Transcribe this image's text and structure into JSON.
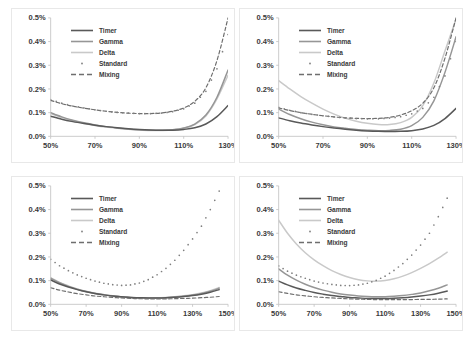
{
  "figure": {
    "layout": "2x2 grid of line charts",
    "background_color": "#ffffff",
    "panel_border_color": "#e8e8e8"
  },
  "series_styles": {
    "Timer": {
      "color": "#595959",
      "style": "solid",
      "width": 1.5
    },
    "Gamma": {
      "color": "#969696",
      "style": "solid",
      "width": 1.5
    },
    "Delta": {
      "color": "#c9c9c9",
      "style": "solid",
      "width": 1.5
    },
    "Standard": {
      "color": "#7f7f7f",
      "style": "dotted-markers",
      "width": 1
    },
    "Mixing": {
      "color": "#6e6e6e",
      "style": "dashed",
      "width": 1.2
    }
  },
  "legend": {
    "entries": [
      {
        "label": "Timer",
        "key": "line-solid-dark"
      },
      {
        "label": "Gamma",
        "key": "line-solid-medium"
      },
      {
        "label": "Delta",
        "key": "line-solid-light"
      },
      {
        "label": "Standard",
        "key": "marker-dot"
      },
      {
        "label": "Mixing",
        "key": "line-dashed"
      }
    ]
  },
  "chart_data": [
    {
      "type": "line",
      "panel": "top-left",
      "title": "",
      "xlabel": "",
      "ylabel": "",
      "grid": false,
      "legend_position": "upper-left-inside",
      "xlim": [
        50,
        130
      ],
      "ylim": [
        0.0,
        0.5
      ],
      "xticks": [
        "50%",
        "70%",
        "90%",
        "110%",
        "130%"
      ],
      "yticks": [
        "0.0%",
        "0.1%",
        "0.2%",
        "0.3%",
        "0.4%",
        "0.5%"
      ],
      "x": [
        50,
        55,
        60,
        65,
        70,
        75,
        80,
        85,
        90,
        95,
        100,
        105,
        110,
        115,
        120,
        125,
        130
      ],
      "series": [
        {
          "name": "Timer",
          "values": [
            0.085,
            0.072,
            0.062,
            0.054,
            0.047,
            0.041,
            0.036,
            0.032,
            0.029,
            0.027,
            0.026,
            0.026,
            0.029,
            0.036,
            0.052,
            0.083,
            0.13
          ]
        },
        {
          "name": "Gamma",
          "values": [
            0.1,
            0.082,
            0.068,
            0.057,
            0.048,
            0.041,
            0.035,
            0.031,
            0.028,
            0.026,
            0.026,
            0.028,
            0.035,
            0.052,
            0.09,
            0.165,
            0.28
          ]
        },
        {
          "name": "Delta",
          "values": [
            0.096,
            0.08,
            0.066,
            0.055,
            0.046,
            0.039,
            0.034,
            0.03,
            0.027,
            0.025,
            0.025,
            0.027,
            0.034,
            0.05,
            0.086,
            0.158,
            0.258
          ]
        },
        {
          "name": "Standard",
          "values": [
            0.155,
            0.14,
            0.128,
            0.12,
            0.112,
            0.106,
            0.101,
            0.098,
            0.096,
            0.096,
            0.098,
            0.104,
            0.116,
            0.14,
            0.19,
            0.285,
            0.43
          ]
        },
        {
          "name": "Mixing",
          "values": [
            0.152,
            0.138,
            0.127,
            0.119,
            0.112,
            0.106,
            0.101,
            0.098,
            0.096,
            0.096,
            0.099,
            0.106,
            0.12,
            0.148,
            0.205,
            0.32,
            0.5
          ]
        }
      ]
    },
    {
      "type": "line",
      "panel": "top-right",
      "title": "",
      "xlabel": "",
      "ylabel": "",
      "grid": false,
      "legend_position": "upper-left-inside",
      "xlim": [
        50,
        130
      ],
      "ylim": [
        0.0,
        0.5
      ],
      "xticks": [
        "50%",
        "70%",
        "90%",
        "110%",
        "130%"
      ],
      "yticks": [
        "0.0%",
        "0.1%",
        "0.2%",
        "0.3%",
        "0.4%",
        "0.5%"
      ],
      "x": [
        50,
        55,
        60,
        65,
        70,
        75,
        80,
        85,
        90,
        95,
        100,
        105,
        110,
        115,
        120,
        125,
        130
      ],
      "series": [
        {
          "name": "Timer",
          "values": [
            0.078,
            0.066,
            0.056,
            0.048,
            0.041,
            0.035,
            0.03,
            0.026,
            0.023,
            0.021,
            0.02,
            0.021,
            0.024,
            0.031,
            0.046,
            0.075,
            0.118
          ]
        },
        {
          "name": "Gamma",
          "values": [
            0.115,
            0.092,
            0.074,
            0.06,
            0.049,
            0.04,
            0.034,
            0.029,
            0.026,
            0.024,
            0.025,
            0.03,
            0.045,
            0.08,
            0.15,
            0.27,
            0.42
          ]
        },
        {
          "name": "Delta",
          "values": [
            0.235,
            0.2,
            0.168,
            0.14,
            0.115,
            0.094,
            0.077,
            0.064,
            0.055,
            0.05,
            0.05,
            0.058,
            0.08,
            0.13,
            0.225,
            0.36,
            0.495
          ]
        },
        {
          "name": "Standard",
          "values": [
            0.122,
            0.11,
            0.1,
            0.093,
            0.087,
            0.082,
            0.078,
            0.075,
            0.074,
            0.074,
            0.077,
            0.083,
            0.095,
            0.118,
            0.165,
            0.255,
            0.4
          ]
        },
        {
          "name": "Mixing",
          "values": [
            0.12,
            0.109,
            0.1,
            0.093,
            0.087,
            0.082,
            0.078,
            0.076,
            0.075,
            0.076,
            0.08,
            0.09,
            0.108,
            0.14,
            0.205,
            0.33,
            0.5
          ]
        }
      ]
    },
    {
      "type": "line",
      "panel": "bottom-left",
      "title": "",
      "xlabel": "",
      "ylabel": "",
      "grid": false,
      "legend_position": "upper-left-inside",
      "xlim": [
        50,
        150
      ],
      "ylim": [
        0.0,
        0.5
      ],
      "xticks": [
        "50%",
        "70%",
        "90%",
        "110%",
        "130%",
        "150%"
      ],
      "yticks": [
        "0.0%",
        "0.1%",
        "0.2%",
        "0.3%",
        "0.4%",
        "0.5%"
      ],
      "x": [
        50,
        55,
        60,
        65,
        70,
        75,
        80,
        85,
        90,
        95,
        100,
        105,
        110,
        115,
        120,
        125,
        130,
        135,
        140,
        145
      ],
      "series": [
        {
          "name": "Timer",
          "values": [
            0.103,
            0.086,
            0.073,
            0.062,
            0.053,
            0.046,
            0.04,
            0.035,
            0.032,
            0.029,
            0.028,
            0.027,
            0.027,
            0.028,
            0.03,
            0.033,
            0.037,
            0.043,
            0.051,
            0.062
          ]
        },
        {
          "name": "Gamma",
          "values": [
            0.11,
            0.091,
            0.076,
            0.064,
            0.054,
            0.046,
            0.04,
            0.035,
            0.031,
            0.029,
            0.027,
            0.027,
            0.027,
            0.028,
            0.031,
            0.034,
            0.039,
            0.046,
            0.055,
            0.068
          ]
        },
        {
          "name": "Delta",
          "values": [
            0.112,
            0.093,
            0.078,
            0.065,
            0.055,
            0.047,
            0.041,
            0.036,
            0.032,
            0.029,
            0.028,
            0.027,
            0.028,
            0.029,
            0.032,
            0.036,
            0.041,
            0.048,
            0.058,
            0.071
          ]
        },
        {
          "name": "Standard",
          "values": [
            0.19,
            0.163,
            0.142,
            0.124,
            0.11,
            0.098,
            0.089,
            0.083,
            0.08,
            0.082,
            0.09,
            0.104,
            0.125,
            0.152,
            0.186,
            0.228,
            0.276,
            0.33,
            0.4,
            0.478
          ]
        },
        {
          "name": "Mixing",
          "values": [
            0.07,
            0.06,
            0.052,
            0.045,
            0.04,
            0.035,
            0.032,
            0.029,
            0.027,
            0.025,
            0.024,
            0.023,
            0.023,
            0.023,
            0.024,
            0.025,
            0.026,
            0.028,
            0.03,
            0.033
          ]
        }
      ]
    },
    {
      "type": "line",
      "panel": "bottom-right",
      "title": "",
      "xlabel": "",
      "ylabel": "",
      "grid": false,
      "legend_position": "upper-left-inside",
      "xlim": [
        50,
        150
      ],
      "ylim": [
        0.0,
        0.5
      ],
      "xticks": [
        "50%",
        "70%",
        "90%",
        "110%",
        "130%",
        "150%"
      ],
      "yticks": [
        "0.0%",
        "0.1%",
        "0.2%",
        "0.3%",
        "0.4%",
        "0.5%"
      ],
      "x": [
        50,
        55,
        60,
        65,
        70,
        75,
        80,
        85,
        90,
        95,
        100,
        105,
        110,
        115,
        120,
        125,
        130,
        135,
        140,
        145
      ],
      "series": [
        {
          "name": "Timer",
          "values": [
            0.098,
            0.082,
            0.069,
            0.059,
            0.05,
            0.043,
            0.037,
            0.033,
            0.029,
            0.027,
            0.025,
            0.025,
            0.025,
            0.026,
            0.028,
            0.031,
            0.035,
            0.04,
            0.047,
            0.056
          ]
        },
        {
          "name": "Gamma",
          "values": [
            0.15,
            0.123,
            0.102,
            0.085,
            0.071,
            0.06,
            0.051,
            0.044,
            0.039,
            0.035,
            0.033,
            0.032,
            0.032,
            0.034,
            0.037,
            0.042,
            0.048,
            0.057,
            0.068,
            0.082
          ]
        },
        {
          "name": "Delta",
          "values": [
            0.355,
            0.3,
            0.255,
            0.218,
            0.188,
            0.163,
            0.142,
            0.126,
            0.113,
            0.104,
            0.099,
            0.098,
            0.101,
            0.108,
            0.119,
            0.134,
            0.152,
            0.172,
            0.195,
            0.22
          ]
        },
        {
          "name": "Standard",
          "values": [
            0.162,
            0.14,
            0.123,
            0.11,
            0.098,
            0.09,
            0.084,
            0.08,
            0.079,
            0.082,
            0.089,
            0.101,
            0.119,
            0.143,
            0.172,
            0.208,
            0.25,
            0.3,
            0.37,
            0.448
          ]
        },
        {
          "name": "Mixing",
          "values": [
            0.053,
            0.046,
            0.04,
            0.036,
            0.032,
            0.029,
            0.027,
            0.025,
            0.023,
            0.022,
            0.021,
            0.02,
            0.02,
            0.02,
            0.02,
            0.02,
            0.021,
            0.021,
            0.022,
            0.023
          ]
        }
      ]
    }
  ]
}
